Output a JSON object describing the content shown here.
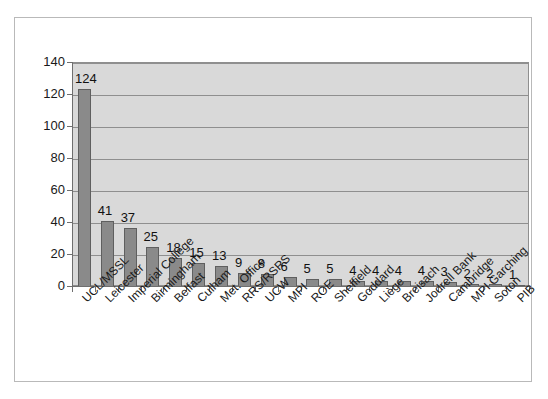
{
  "chart_data": {
    "type": "bar",
    "title": "",
    "subtitle": "",
    "xlabel": "",
    "ylabel": "",
    "ylim": [
      0,
      140
    ],
    "ytick_step": 20,
    "yticks": [
      140,
      120,
      100,
      80,
      60,
      40,
      20,
      0
    ],
    "grid": true,
    "legend": false,
    "legend_position": "none",
    "categories": [
      "UCL/MSSL",
      "Leicester",
      "Imperial College",
      "Birmingham",
      "Belfast",
      "Culham",
      "Met. Office",
      "RRS/RSRS",
      "UCW",
      "MPI",
      "ROE",
      "Sheffield",
      "Goddard",
      "Liège",
      "Breisach",
      "Jodrell Bank",
      "Cambridge",
      "MPI Garching",
      "Soton",
      "PIB"
    ],
    "values": [
      124,
      41,
      37,
      25,
      18,
      15,
      13,
      9,
      8,
      6,
      5,
      5,
      4,
      4,
      4,
      4,
      3,
      2,
      2,
      1
    ],
    "value_labels": [
      "124",
      "41",
      "37",
      "25",
      "18",
      "15",
      "13",
      "9",
      "8",
      "6",
      "5",
      "5",
      "4",
      "4",
      "4",
      "4",
      "3",
      "2",
      "2",
      "1"
    ],
    "colors": {
      "bar_fill": "#8a8a8a",
      "bar_border": "#5f5f5f",
      "plot_background": "#d9d9d9",
      "chart_background": "#ffffff",
      "gridline": "#8f8f8f",
      "axis": "#6f6f6f",
      "text": "#1a1a1a"
    }
  }
}
